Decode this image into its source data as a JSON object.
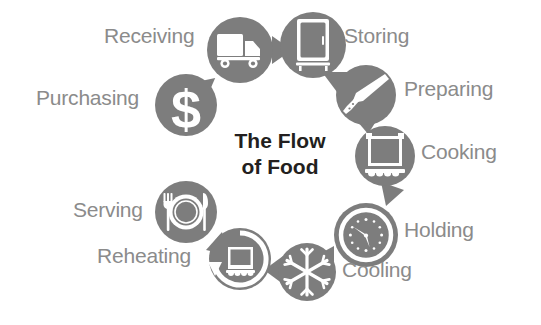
{
  "diagram": {
    "title_line_1": "The Flow",
    "title_line_2": "of Food",
    "colors": {
      "circle_fill": "#7d7d7d",
      "icon_fill": "#ffffff",
      "arrow_fill": "#7d7d7d",
      "label_text": "#8b8b8b",
      "title_text": "#231f20",
      "background": "#ffffff"
    },
    "stages": [
      {
        "id": "receiving",
        "label": "Receiving",
        "icon": "delivery-truck-icon",
        "order": 2,
        "cx": 240,
        "cy": 50,
        "r": 33,
        "label_x": 104,
        "label_y": 25,
        "label_side": "left"
      },
      {
        "id": "storing",
        "label": "Storing",
        "icon": "refrigerator-icon",
        "order": 3,
        "cx": 313,
        "cy": 45,
        "r": 33,
        "label_x": 344,
        "label_y": 25,
        "label_side": "right"
      },
      {
        "id": "preparing",
        "label": "Preparing",
        "icon": "chef-knife-icon",
        "order": 4,
        "cx": 366,
        "cy": 95,
        "r": 30,
        "label_x": 404,
        "label_y": 78,
        "label_side": "right"
      },
      {
        "id": "cooking",
        "label": "Cooking",
        "icon": "cooking-pot-icon",
        "order": 5,
        "cx": 385,
        "cy": 156,
        "r": 30,
        "label_x": 421,
        "label_y": 141,
        "label_side": "right"
      },
      {
        "id": "holding",
        "label": "Holding",
        "icon": "clock-icon",
        "order": 6,
        "cx": 366,
        "cy": 235,
        "r": 32,
        "label_x": 404,
        "label_y": 219,
        "label_side": "right"
      },
      {
        "id": "cooling",
        "label": "Cooling",
        "icon": "snowflake-icon",
        "order": 7,
        "cx": 307,
        "cy": 272,
        "r": 29,
        "label_x": 342,
        "label_y": 259,
        "label_side": "right"
      },
      {
        "id": "reheating",
        "label": "Reheating",
        "icon": "reheat-pot-icon",
        "order": 8,
        "cx": 240,
        "cy": 259,
        "r": 31,
        "label_x": 97,
        "label_y": 245,
        "label_side": "left"
      },
      {
        "id": "serving",
        "label": "Serving",
        "icon": "plate-fork-knife-icon",
        "order": 9,
        "cx": 186,
        "cy": 212,
        "r": 31,
        "label_x": 73,
        "label_y": 199,
        "label_side": "left"
      },
      {
        "id": "purchasing",
        "label": "Purchasing",
        "icon": "dollar-sign-icon",
        "order": 1,
        "cx": 186,
        "cy": 105,
        "r": 31,
        "label_x": 36,
        "label_y": 87,
        "label_side": "left"
      }
    ],
    "arrows": [
      {
        "id": "arrow-purchasing-to-receiving",
        "from": "purchasing",
        "to": "receiving"
      },
      {
        "id": "arrow-receiving-to-storing",
        "from": "receiving",
        "to": "storing"
      },
      {
        "id": "arrow-storing-to-preparing",
        "from": "storing",
        "to": "preparing"
      },
      {
        "id": "arrow-preparing-to-cooking",
        "from": "preparing",
        "to": "cooking"
      },
      {
        "id": "arrow-cooking-to-holding",
        "from": "cooking",
        "to": "holding"
      },
      {
        "id": "arrow-holding-to-cooling",
        "from": "holding",
        "to": "cooling"
      },
      {
        "id": "arrow-cooling-to-reheating",
        "from": "cooling",
        "to": "reheating"
      },
      {
        "id": "arrow-reheating-to-serving",
        "from": "reheating",
        "to": "serving"
      }
    ],
    "center": {
      "x": 280,
      "y": 140
    }
  }
}
